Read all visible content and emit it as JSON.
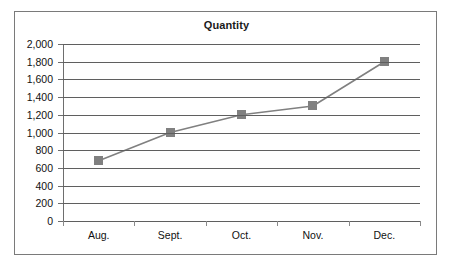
{
  "chart_data": {
    "type": "line",
    "title": "Quantity",
    "xlabel": "",
    "ylabel": "",
    "categories": [
      "Aug.",
      "Sept.",
      "Oct.",
      "Nov.",
      "Dec."
    ],
    "values": [
      680,
      1000,
      1200,
      1300,
      1800
    ],
    "series": [
      {
        "name": "Quantity",
        "values": [
          680,
          1000,
          1200,
          1300,
          1800
        ]
      }
    ],
    "ylim": [
      0,
      2000
    ],
    "y_tick_step": 200,
    "y_tick_labels": [
      "2,000",
      "1,800",
      "1,600",
      "1,400",
      "1,200",
      "1,000",
      "800",
      "600",
      "400",
      "200",
      "0"
    ],
    "y_tick_values": [
      2000,
      1800,
      1600,
      1400,
      1200,
      1000,
      800,
      600,
      400,
      200,
      0
    ],
    "grid": "horizontal",
    "legend": "none",
    "marker": "square",
    "colors": {
      "line": "#808080",
      "marker": "#808080",
      "gridline": "#5f5f5f",
      "axis": "#6e6e6e",
      "border": "#7a7a7a",
      "text": "#111111",
      "title": "#1a1a1a",
      "background": "#ffffff"
    }
  }
}
